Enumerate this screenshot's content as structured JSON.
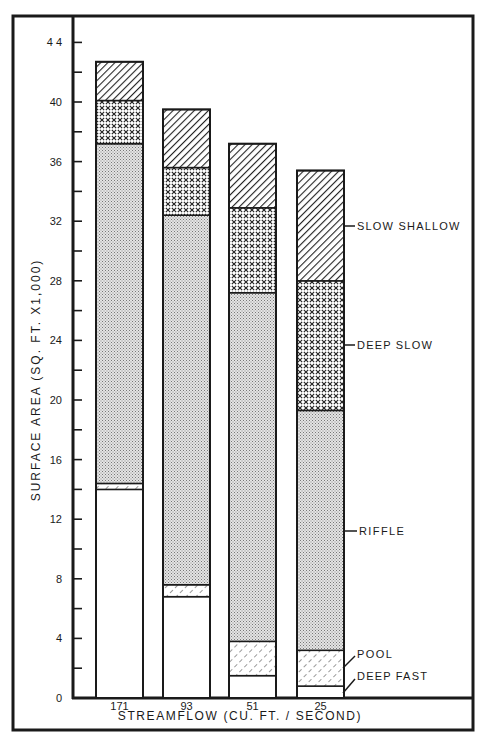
{
  "chart_data": {
    "type": "bar",
    "stacked": true,
    "title": "",
    "xlabel": "STREAMFLOW (CU. FT. / SECOND)",
    "ylabel": "SURFACE AREA (SQ. FT. X1,000)",
    "ylim": [
      0,
      44
    ],
    "yticks": [
      0,
      4,
      8,
      12,
      16,
      20,
      24,
      28,
      32,
      36,
      40,
      44
    ],
    "ytick_labels": [
      "0",
      "4",
      "8",
      "12",
      "16",
      "20",
      "24",
      "28",
      "32",
      "36",
      "40",
      "4 4"
    ],
    "minor_yticks_step": 2,
    "grid": false,
    "legend_position": "right, labels attached to last bar",
    "categories": [
      "171",
      "93",
      "51",
      "25"
    ],
    "series": [
      {
        "name": "DEEP FAST",
        "pattern": "blank",
        "values": [
          14.0,
          6.8,
          1.5,
          0.8
        ]
      },
      {
        "name": "POOL",
        "pattern": "sparse-hatch",
        "values": [
          0.4,
          0.8,
          2.3,
          2.4
        ]
      },
      {
        "name": "RIFFLE",
        "pattern": "stipple",
        "values": [
          22.8,
          24.8,
          23.4,
          16.1
        ]
      },
      {
        "name": "DEEP SLOW",
        "pattern": "crosshatch",
        "values": [
          2.9,
          3.2,
          5.7,
          8.7
        ]
      },
      {
        "name": "SLOW SHALLOW",
        "pattern": "dense-hatch",
        "values": [
          2.6,
          3.9,
          4.3,
          7.4
        ]
      }
    ],
    "totals": [
      42.7,
      39.5,
      37.2,
      35.4
    ]
  },
  "labels": {
    "x_axis_title": "STREAMFLOW (CU. FT. / SECOND)",
    "y_axis_title": "SURFACE AREA (SQ. FT. X1,000)",
    "legend": {
      "slow_shallow": "SLOW SHALLOW",
      "deep_slow": "DEEP SLOW",
      "riffle": "RIFFLE",
      "pool": "POOL",
      "deep_fast": "DEEP FAST"
    }
  }
}
